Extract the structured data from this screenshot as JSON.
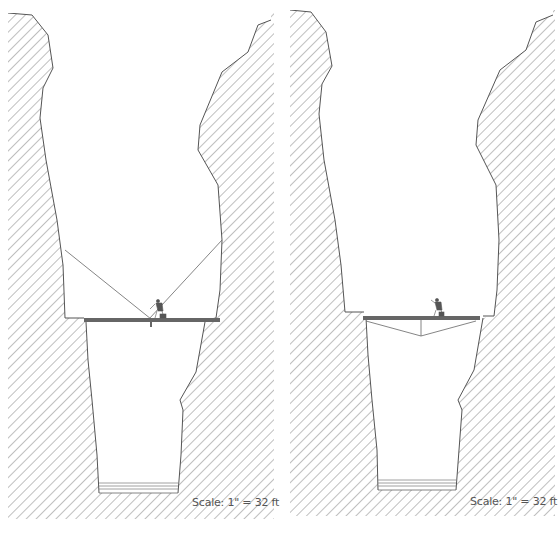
{
  "figure": {
    "panels": [
      {
        "id": "left",
        "label": "Rigging with rope tie-backs to cave walls",
        "scale_label": "Scale: 1\" = 32 ft",
        "elements": [
          "hatched-rock",
          "upper-chamber",
          "lower-shaft",
          "bridge-platform",
          "support-ropes",
          "climber-figure",
          "shaft-floor-lines"
        ]
      },
      {
        "id": "right",
        "label": "Rigging with under-slung truss",
        "scale_label": "Scale: 1\" = 32 ft",
        "elements": [
          "hatched-rock",
          "upper-chamber",
          "lower-shaft",
          "bridge-platform",
          "truss-cables",
          "climber-figure",
          "shaft-floor-lines"
        ]
      }
    ],
    "colors": {
      "hatch": "#8a8a8a",
      "outline": "#555555",
      "platform": "#666666",
      "background": "#ffffff"
    }
  }
}
